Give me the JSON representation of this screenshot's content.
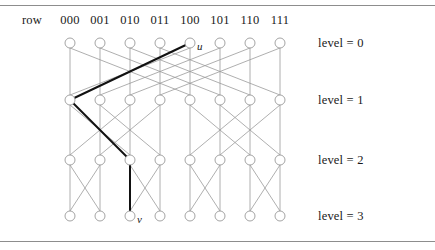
{
  "figure": {
    "kind": "butterfly-network-diagram",
    "row_label": "row",
    "column_headers": [
      "000",
      "001",
      "010",
      "011",
      "100",
      "101",
      "110",
      "111"
    ],
    "level_labels": [
      "level = 0",
      "level = 1",
      "level = 2",
      "level = 3"
    ],
    "node_labels": [
      {
        "id": "u",
        "text": "u",
        "level": 0,
        "column": "100"
      },
      {
        "id": "v",
        "text": "v",
        "level": 3,
        "column": "010"
      }
    ],
    "colors": {
      "edge": "#9a9a9a",
      "node_stroke": "#9a9a9a",
      "highlight": "#111111",
      "rule": "#8d8d8d",
      "text": "#1a1a1a",
      "background": "#ffffff"
    },
    "geometry": {
      "column_x": [
        70,
        100,
        130,
        160,
        190,
        220,
        250,
        280
      ],
      "level_y": [
        43,
        100,
        160,
        216
      ],
      "node_radius": 5,
      "header_y": 20,
      "level_label_x": 318
    },
    "edges": {
      "description": "Butterfly network: level L to L+1 connects node i straight down and cross to i XOR (4 >> L)",
      "cross_span_by_level": [
        4,
        2,
        1
      ]
    },
    "highlight_path": {
      "description": "Bold route from u at level 0 column 100 down to v at level 3 column 010",
      "nodes": [
        {
          "level": 0,
          "column_index": 4
        },
        {
          "level": 1,
          "column_index": 0
        },
        {
          "level": 2,
          "column_index": 2
        },
        {
          "level": 3,
          "column_index": 2
        }
      ]
    }
  }
}
